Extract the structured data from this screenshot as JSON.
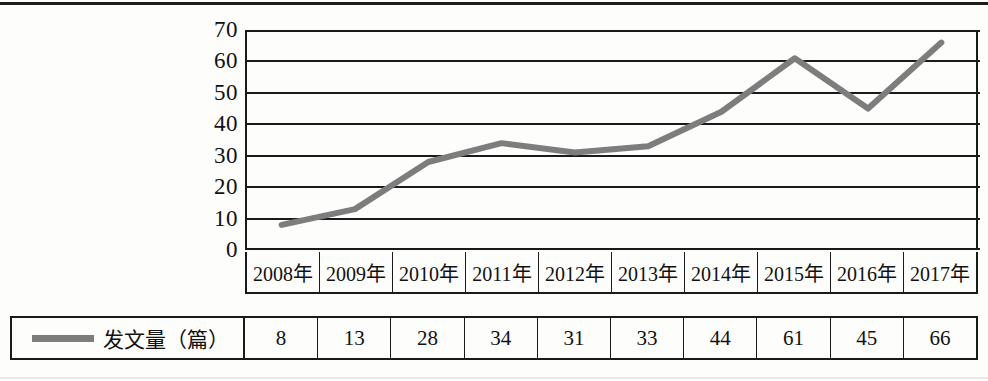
{
  "chart_data": {
    "type": "line",
    "title": "",
    "xlabel": "",
    "ylabel": "",
    "categories": [
      "2008年",
      "2009年",
      "2010年",
      "2011年",
      "2012年",
      "2013年",
      "2014年",
      "2015年",
      "2016年",
      "2017年"
    ],
    "series": [
      {
        "name": "发文量（篇）",
        "values": [
          8,
          13,
          28,
          34,
          31,
          33,
          44,
          61,
          45,
          66
        ],
        "color": "#7d7d7d"
      }
    ],
    "ylim": [
      0,
      70
    ],
    "yticks": [
      70,
      60,
      50,
      40,
      30,
      20,
      10,
      0
    ],
    "grid": true,
    "legend_position": "bottom-left",
    "markers": false
  },
  "legend": {
    "label": "发文量（篇）",
    "swatch": "line-swatch",
    "color": "#7d7d7d"
  },
  "colors": {
    "series_line": "#7d7d7d",
    "axis": "#1a1a1a",
    "background": "#fdfdfc"
  }
}
